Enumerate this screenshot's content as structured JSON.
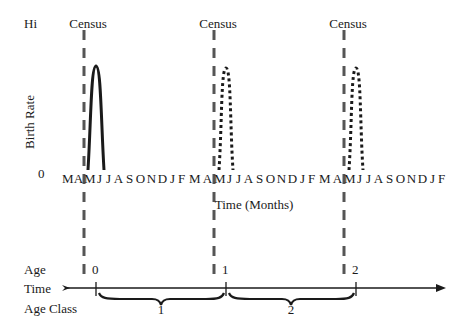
{
  "figure": {
    "y_axis": {
      "label": "Birth Rate",
      "hi_label": "Hi",
      "zero_label": "0"
    },
    "x_axis": {
      "label": "Time (Months)",
      "months": [
        "M",
        "A",
        "M",
        "J",
        "J",
        "A",
        "S",
        "O",
        "N",
        "D",
        "J",
        "F",
        "M",
        "A",
        "M",
        "J",
        "J",
        "A",
        "S",
        "O",
        "N",
        "D",
        "J",
        "F",
        "M",
        "A",
        "M",
        "J",
        "J",
        "A",
        "S",
        "O",
        "N",
        "D",
        "J",
        "F"
      ]
    },
    "census": [
      {
        "label": "Census",
        "month_index": 2
      },
      {
        "label": "Census",
        "month_index": 14
      },
      {
        "label": "Census",
        "month_index": 26
      }
    ],
    "pulses": [
      {
        "style": "solid",
        "peak_month": "J",
        "year": 1
      },
      {
        "style": "dotted",
        "peak_month": "J",
        "year": 2
      },
      {
        "style": "dotted",
        "peak_month": "J",
        "year": 3
      }
    ],
    "timeline": {
      "row_labels": {
        "age": "Age",
        "time": "Time",
        "age_class": "Age Class"
      },
      "ages": [
        "0",
        "1",
        "2"
      ],
      "age_classes": [
        "1",
        "2"
      ]
    },
    "colors": {
      "ink": "#1a1a1a",
      "dash": "#555555"
    }
  }
}
